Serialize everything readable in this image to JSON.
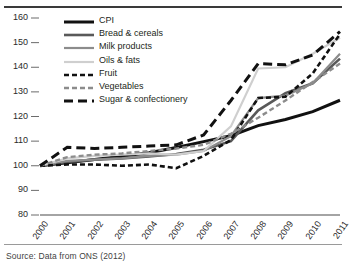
{
  "source_note": "Source: Data from ONS (2012)",
  "legend": {
    "position": "top-left-inside",
    "items": [
      {
        "label": "CPI",
        "color": "#111111",
        "style": "solid",
        "width": 3.0
      },
      {
        "label": "Bread & cereals",
        "color": "#595959",
        "style": "solid",
        "width": 2.6
      },
      {
        "label": "Milk products",
        "color": "#8c8c8c",
        "style": "solid",
        "width": 2.2
      },
      {
        "label": "Oils & fats",
        "color": "#cfcfcf",
        "style": "solid",
        "width": 2.2
      },
      {
        "label": "Fruit",
        "color": "#111111",
        "style": "dashed",
        "width": 2.6
      },
      {
        "label": "Vegetables",
        "color": "#8c8c8c",
        "style": "dashed",
        "width": 2.4
      },
      {
        "label": "Sugar & confectionery",
        "color": "#111111",
        "style": "longdash",
        "width": 3.0
      }
    ]
  },
  "chart_data": {
    "type": "line",
    "title": "",
    "xlabel": "",
    "ylabel": "",
    "grid": false,
    "xlim": [
      2000,
      2011
    ],
    "ylim": [
      80,
      160
    ],
    "yticks": [
      80,
      90,
      100,
      110,
      120,
      130,
      140,
      150,
      160
    ],
    "x": [
      2000,
      2001,
      2002,
      2003,
      2004,
      2005,
      2006,
      2007,
      2008,
      2009,
      2010,
      2011
    ],
    "xticklabels": [
      "2000",
      "2001",
      "2002",
      "2003",
      "2004",
      "2005",
      "2006",
      "2007",
      "2008",
      "2009",
      "2010",
      "2011"
    ],
    "series": [
      {
        "name": "CPI",
        "values": [
          100.0,
          101.2,
          102.5,
          103.9,
          105.3,
          107.4,
          109.8,
          112.2,
          116.3,
          118.8,
          122.0,
          126.6
        ]
      },
      {
        "name": "Bread & cereals",
        "values": [
          100.0,
          101.5,
          102.5,
          103.0,
          103.8,
          104.8,
          106.5,
          110.0,
          122.5,
          129.5,
          133.5,
          143.5
        ]
      },
      {
        "name": "Milk products",
        "values": [
          100.0,
          102.0,
          102.5,
          103.0,
          104.0,
          104.5,
          106.0,
          112.0,
          127.5,
          128.5,
          133.5,
          145.5
        ]
      },
      {
        "name": "Oils & fats",
        "values": [
          100.0,
          103.0,
          104.0,
          104.5,
          105.0,
          104.5,
          106.0,
          116.0,
          139.5,
          140.0,
          145.5,
          152.0
        ]
      },
      {
        "name": "Fruit",
        "values": [
          100.0,
          100.5,
          100.5,
          100.0,
          100.5,
          99.0,
          104.0,
          110.5,
          127.5,
          128.0,
          137.5,
          153.5
        ]
      },
      {
        "name": "Vegetables",
        "values": [
          100.0,
          103.5,
          104.5,
          105.0,
          106.0,
          107.0,
          108.5,
          113.0,
          119.5,
          126.5,
          134.0,
          141.5
        ]
      },
      {
        "name": "Sugar & confectionery",
        "values": [
          100.0,
          107.5,
          107.0,
          107.5,
          108.0,
          108.5,
          112.5,
          126.5,
          141.5,
          141.0,
          145.0,
          154.5
        ]
      }
    ]
  },
  "axes": {
    "y_tick_labels": [
      "160",
      "150",
      "140",
      "130",
      "120",
      "110",
      "100",
      "90",
      "80"
    ]
  }
}
